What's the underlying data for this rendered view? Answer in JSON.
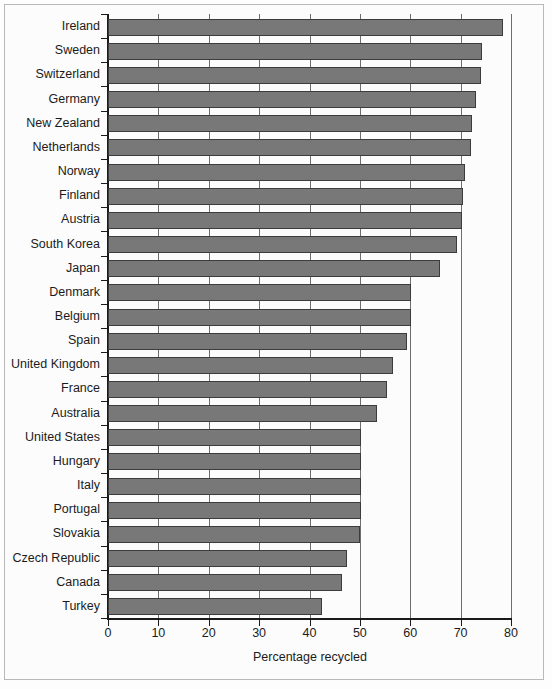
{
  "chart_data": {
    "type": "bar",
    "orientation": "horizontal",
    "title": "",
    "xlabel": "Percentage recycled",
    "ylabel": "",
    "xlim": [
      0,
      80
    ],
    "ylim": null,
    "xticks": [
      0,
      10,
      20,
      30,
      40,
      50,
      60,
      70,
      80
    ],
    "xtick_labels": [
      "0",
      "10",
      "20",
      "30",
      "40",
      "50",
      "60",
      "70",
      "80"
    ],
    "grid": "vertical-only",
    "legend": null,
    "bar_color": "#787878",
    "bar_edge_color": "#3c3c3c",
    "categories": [
      "Ireland",
      "Sweden",
      "Switzerland",
      "Germany",
      "New Zealand",
      "Netherlands",
      "Norway",
      "Finland",
      "Austria",
      "South Korea",
      "Japan",
      "Denmark",
      "Belgium",
      "Spain",
      "United Kingdom",
      "France",
      "Australia",
      "United States",
      "Hungary",
      "Italy",
      "Portugal",
      "Slovakia",
      "Czech Republic",
      "Canada",
      "Turkey"
    ],
    "values": [
      78.5,
      74.2,
      74.0,
      73.0,
      72.2,
      72.0,
      70.8,
      70.4,
      70.3,
      69.3,
      66.0,
      60.2,
      60.1,
      59.3,
      56.5,
      55.4,
      53.4,
      50.3,
      50.2,
      50.2,
      50.2,
      50.1,
      47.4,
      46.5,
      42.5
    ]
  }
}
